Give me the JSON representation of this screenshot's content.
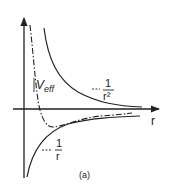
{
  "diagram": {
    "caption": "(a)",
    "axes": {
      "x_label": "r",
      "y_label": ""
    },
    "curves": [
      {
        "name": "centrifugal-term",
        "label_prefix": "~",
        "numerator": "1",
        "denominator": "r²",
        "style": "solid"
      },
      {
        "name": "coulomb-term",
        "label_prefix": "-",
        "numerator": "1",
        "denominator": "r",
        "style": "solid"
      },
      {
        "name": "effective-potential",
        "label": "V",
        "label_sub": "eff",
        "style": "dash-dot"
      }
    ],
    "colors": {
      "ink": "#222222",
      "background": "#ffffff"
    }
  }
}
